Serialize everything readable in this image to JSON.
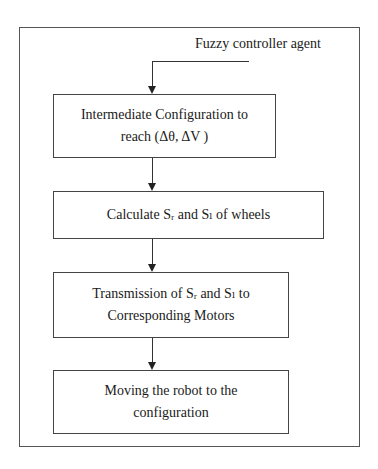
{
  "diagram": {
    "type": "flowchart",
    "input_label": "Fuzzy controller agent",
    "steps": [
      {
        "line1": "Intermediate  Configuration to",
        "line2": "reach  (Δθ,  ΔV )"
      },
      {
        "text": "Calculate Sᵣ and Sₗ of wheels"
      },
      {
        "line1": "Transmission of  Sᵣ and Sₗ to",
        "line2": "Corresponding Motors"
      },
      {
        "line1": "Moving the robot to the",
        "line2": "configuration"
      }
    ]
  }
}
